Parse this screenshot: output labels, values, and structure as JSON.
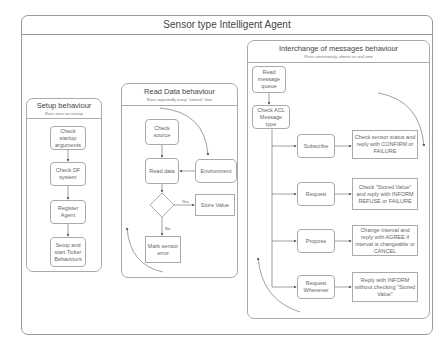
{
  "title": "Sensor type Intelligent Agent",
  "lanes": {
    "setup": {
      "title": "Setup behaviour",
      "subtitle": "Runs once on startup",
      "nodes": [
        "Check startup arguments",
        "Check DF system",
        "Register Agent",
        "Setup and start Ticker Behaviours"
      ]
    },
    "read": {
      "title": "Read Data behaviour",
      "subtitle": "Runs repeatedly every \"interval\" time",
      "nodes": {
        "check_source": "Check source",
        "read_data": "Read data",
        "environment": "Environment",
        "valid_data": "Valid Data",
        "store_value": "Store Value",
        "mark_error": "Mark sensor error",
        "yes": "Yes",
        "no": "No"
      }
    },
    "interchange": {
      "title": "Interchange of messages behaviour",
      "subtitle": "Runs continuously, almost as real-time",
      "read_queue": "Read message queue",
      "check_acl": "Check ACL Message type",
      "rows": [
        {
          "type": "Subscribe",
          "action": "Check sensor status and reply with CONFIRM or FAILURE"
        },
        {
          "type": "Request",
          "action": "Check \"Stored Value\" and reply with INFORM REFUSE or FAILURE"
        },
        {
          "type": "Propose",
          "action": "Change interval and reply with AGREE if interval is changeable or CANCEL"
        },
        {
          "type": "Request Whenever",
          "action": "Reply with INFORM without checking \"Stored Value\""
        }
      ]
    }
  }
}
